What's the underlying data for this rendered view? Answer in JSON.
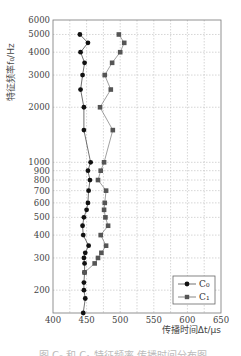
{
  "chart_data": {
    "type": "line",
    "title": "",
    "xlabel": "传播时间Δt/μs",
    "ylabel": "特征频率f₀/Hz",
    "xlim": [
      400,
      650
    ],
    "ylim": [
      150,
      6000
    ],
    "yscale": "log",
    "x_ticks": [
      400,
      450,
      500,
      550,
      600,
      650
    ],
    "y_ticks": [
      200,
      300,
      400,
      500,
      600,
      700,
      800,
      900,
      1000,
      2000,
      3000,
      4000,
      5000,
      6000
    ],
    "grid": true,
    "legend_position": "lower right",
    "series": [
      {
        "name": "C₀",
        "marker": "circle",
        "color": "#111111",
        "points": [
          {
            "f": 5000,
            "t": 440
          },
          {
            "f": 4500,
            "t": 452
          },
          {
            "f": 4000,
            "t": 441
          },
          {
            "f": 3500,
            "t": 447
          },
          {
            "f": 3000,
            "t": 444
          },
          {
            "f": 2500,
            "t": 441
          },
          {
            "f": 2000,
            "t": 446
          },
          {
            "f": 1500,
            "t": 446
          },
          {
            "f": 1000,
            "t": 456
          },
          {
            "f": 900,
            "t": 452
          },
          {
            "f": 800,
            "t": 455
          },
          {
            "f": 700,
            "t": 453
          },
          {
            "f": 600,
            "t": 452
          },
          {
            "f": 550,
            "t": 450
          },
          {
            "f": 500,
            "t": 446
          },
          {
            "f": 450,
            "t": 444
          },
          {
            "f": 400,
            "t": 445
          },
          {
            "f": 350,
            "t": 453
          },
          {
            "f": 320,
            "t": 448
          },
          {
            "f": 300,
            "t": 446
          },
          {
            "f": 280,
            "t": 447
          },
          {
            "f": 250,
            "t": 447
          },
          {
            "f": 220,
            "t": 446
          },
          {
            "f": 200,
            "t": 446
          },
          {
            "f": 180,
            "t": 448
          },
          {
            "f": 150,
            "t": 445
          }
        ]
      },
      {
        "name": "C₁",
        "marker": "square",
        "color": "#555555",
        "points": [
          {
            "f": 5000,
            "t": 498
          },
          {
            "f": 4500,
            "t": 506
          },
          {
            "f": 4000,
            "t": 500
          },
          {
            "f": 3500,
            "t": 488
          },
          {
            "f": 3000,
            "t": 477
          },
          {
            "f": 2500,
            "t": 486
          },
          {
            "f": 2000,
            "t": 470
          },
          {
            "f": 1500,
            "t": 489
          },
          {
            "f": 1000,
            "t": 476
          },
          {
            "f": 900,
            "t": 471
          },
          {
            "f": 800,
            "t": 467
          },
          {
            "f": 700,
            "t": 479
          },
          {
            "f": 600,
            "t": 477
          },
          {
            "f": 550,
            "t": 476
          },
          {
            "f": 500,
            "t": 478
          },
          {
            "f": 450,
            "t": 482
          },
          {
            "f": 400,
            "t": 471
          },
          {
            "f": 350,
            "t": 479
          },
          {
            "f": 320,
            "t": 472
          },
          {
            "f": 300,
            "t": 467
          },
          {
            "f": 280,
            "t": 462
          },
          {
            "f": 250,
            "t": 447
          }
        ]
      }
    ]
  },
  "caption": "图  C₀ 和 C₁ 特征频率-传播时间分布图"
}
